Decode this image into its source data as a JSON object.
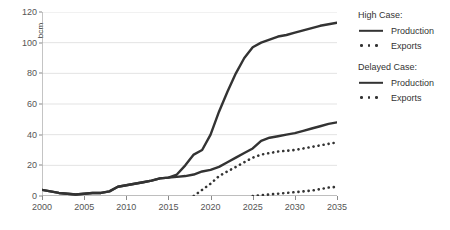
{
  "chart_data": {
    "type": "line",
    "title": "",
    "xlabel": "",
    "ylabel": "bcm",
    "xlim": [
      2000,
      2035
    ],
    "ylim": [
      0,
      120
    ],
    "grid": "horizontal",
    "legend_position": "right",
    "x_ticks": [
      "2000",
      "2005",
      "2010",
      "2015",
      "2020",
      "2025",
      "2030",
      "2035"
    ],
    "y_ticks": [
      "0",
      "20",
      "40",
      "60",
      "80",
      "100",
      "120"
    ],
    "x": [
      2000,
      2001,
      2002,
      2003,
      2004,
      2005,
      2006,
      2007,
      2008,
      2009,
      2010,
      2011,
      2012,
      2013,
      2014,
      2015,
      2016,
      2017,
      2018,
      2019,
      2020,
      2021,
      2022,
      2023,
      2024,
      2025,
      2026,
      2027,
      2028,
      2029,
      2030,
      2031,
      2032,
      2033,
      2034,
      2035
    ],
    "series": [
      {
        "name": "High Case: Production",
        "style": "solid",
        "color": "#333333",
        "values": [
          4,
          3,
          2,
          1.5,
          1,
          1.5,
          2,
          2,
          3,
          6,
          7,
          8,
          9,
          10,
          11.5,
          12,
          14,
          20,
          27,
          30,
          40,
          55,
          68,
          80,
          90,
          97,
          100,
          102,
          104,
          105,
          106.5,
          108,
          109.5,
          111,
          112,
          113
        ]
      },
      {
        "name": "High Case: Exports",
        "style": "dotted",
        "color": "#333333",
        "values": [
          null,
          null,
          null,
          null,
          null,
          null,
          null,
          null,
          null,
          null,
          null,
          null,
          null,
          null,
          null,
          null,
          null,
          null,
          0,
          4,
          8,
          13,
          16,
          19,
          22,
          25,
          27,
          28,
          29,
          29.5,
          30,
          31,
          32,
          33,
          34,
          35
        ]
      },
      {
        "name": "Delayed Case: Production",
        "style": "solid",
        "color": "#333333",
        "values": [
          4,
          3,
          2,
          1.5,
          1,
          1.5,
          2,
          2,
          3,
          6,
          7,
          8,
          9,
          10,
          11.5,
          12,
          12.5,
          13,
          14,
          16,
          17,
          19,
          22,
          25,
          28,
          31,
          36,
          38,
          39,
          40,
          41,
          42.5,
          44,
          45.5,
          47,
          48
        ]
      },
      {
        "name": "Delayed Case: Exports",
        "style": "dotted",
        "color": "#333333",
        "values": [
          null,
          null,
          null,
          null,
          null,
          null,
          null,
          null,
          null,
          null,
          null,
          null,
          null,
          null,
          null,
          null,
          null,
          null,
          null,
          null,
          null,
          null,
          null,
          null,
          null,
          0,
          0.5,
          1,
          1.5,
          2,
          2.5,
          3,
          3.5,
          4.5,
          5.5,
          6
        ]
      }
    ]
  },
  "axes": {
    "y_label": "bcm"
  },
  "legend": {
    "groups": [
      {
        "title": "High Case:",
        "entries": [
          {
            "label": "Production",
            "style": "solid"
          },
          {
            "label": "Exports",
            "style": "dotted"
          }
        ]
      },
      {
        "title": "Delayed Case:",
        "entries": [
          {
            "label": "Production",
            "style": "solid"
          },
          {
            "label": "Exports",
            "style": "dotted"
          }
        ]
      }
    ]
  }
}
